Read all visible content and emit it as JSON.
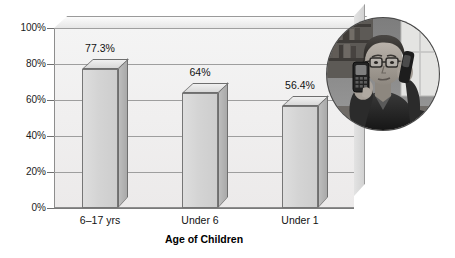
{
  "chart_data": {
    "type": "bar",
    "title": "",
    "subtitle": "",
    "categories": [
      "6–17 yrs",
      "Under 6",
      "Under 1"
    ],
    "values": [
      77.3,
      64,
      56.4
    ],
    "data_labels": [
      "77.3%",
      "64%",
      "56.4%"
    ],
    "xlabel": "Age of Children",
    "ylabel": "",
    "ylim": [
      0,
      100
    ],
    "yticks": [
      0,
      20,
      40,
      60,
      80,
      100
    ],
    "ytick_labels": [
      "0%",
      "20%",
      "40%",
      "60%",
      "80%",
      "100%"
    ],
    "grid": true,
    "legend": false,
    "legend_position": "none",
    "style": "3d-bar",
    "series": [
      {
        "name": "Percent",
        "values": [
          77.3,
          64,
          56.4
        ]
      }
    ]
  },
  "colors": {
    "bar_front": "#d4d4d4",
    "bar_side": "#aeaeae",
    "bar_top": "#e6e6e6",
    "bar_outline": "#6e6e6e",
    "plot_background": "#efefef",
    "gridline": "#9e9e9e",
    "text": "#111111",
    "page_background": "#ffffff"
  },
  "inset": {
    "name": "woman-on-phone-photo",
    "description": "Grayscale circular photograph of a woman wearing glasses holding a cordless phone to her ear and a mobile handset in her other hand",
    "shape": "circle",
    "grayscale": true
  }
}
